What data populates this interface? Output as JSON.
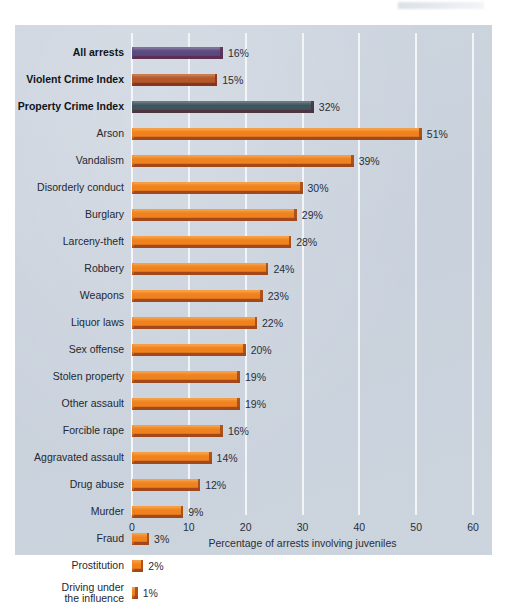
{
  "chart_data": {
    "type": "bar",
    "orientation": "horizontal",
    "title": "",
    "xlabel": "Percentage of arrests involving juveniles",
    "ylabel": "",
    "xlim": [
      0,
      60
    ],
    "xticks": [
      0,
      10,
      20,
      30,
      40,
      50,
      60
    ],
    "grid": true,
    "legend": false,
    "value_suffix": "%",
    "categories": [
      "All arrests",
      "Violent Crime Index",
      "Property Crime Index",
      "Arson",
      "Vandalism",
      "Disorderly conduct",
      "Burglary",
      "Larceny-theft",
      "Robbery",
      "Weapons",
      "Liquor laws",
      "Sex offense",
      "Stolen property",
      "Other assault",
      "Forcible rape",
      "Aggravated assault",
      "Drug abuse",
      "Murder",
      "Fraud",
      "Prostitution",
      "Driving under the influence"
    ],
    "values": [
      16,
      15,
      32,
      51,
      39,
      30,
      29,
      28,
      24,
      23,
      22,
      20,
      19,
      19,
      16,
      14,
      12,
      9,
      3,
      2,
      1
    ],
    "value_labels": [
      "16%",
      "15%",
      "32%",
      "51%",
      "39%",
      "30%",
      "29%",
      "28%",
      "24%",
      "23%",
      "22%",
      "20%",
      "19%",
      "19%",
      "16%",
      "14%",
      "12%",
      "9%",
      "3%",
      "2%",
      "1%"
    ],
    "bar_colors": [
      "#5b4a82",
      "#b4572a",
      "#3e5560",
      "#f0821e",
      "#f0821e",
      "#f0821e",
      "#f0821e",
      "#f0821e",
      "#f0821e",
      "#f0821e",
      "#f0821e",
      "#f0821e",
      "#f0821e",
      "#f0821e",
      "#f0821e",
      "#f0821e",
      "#f0821e",
      "#f0821e",
      "#f0821e",
      "#f0821e",
      "#f0821e"
    ],
    "emphasis": [
      true,
      true,
      true,
      false,
      false,
      false,
      false,
      false,
      false,
      false,
      false,
      false,
      false,
      false,
      false,
      false,
      false,
      false,
      false,
      false,
      false
    ],
    "label_lines": [
      [
        "All arrests"
      ],
      [
        "Violent Crime Index"
      ],
      [
        "Property Crime Index"
      ],
      [
        "Arson"
      ],
      [
        "Vandalism"
      ],
      [
        "Disorderly conduct"
      ],
      [
        "Burglary"
      ],
      [
        "Larceny-theft"
      ],
      [
        "Robbery"
      ],
      [
        "Weapons"
      ],
      [
        "Liquor laws"
      ],
      [
        "Sex offense"
      ],
      [
        "Stolen property"
      ],
      [
        "Other assault"
      ],
      [
        "Forcible rape"
      ],
      [
        "Aggravated assault"
      ],
      [
        "Drug abuse"
      ],
      [
        "Murder"
      ],
      [
        "Fraud"
      ],
      [
        "Prostitution"
      ],
      [
        "Driving under",
        "the influence"
      ]
    ]
  },
  "colors": {
    "panel_background": "#ccd4de",
    "gridline": "#f4f7fa",
    "text": "#2a2f38",
    "orange_bar": "#f0821e",
    "orange_bar_shadow": "#c0441a",
    "purple_bar": "#5b4a82",
    "sienna_bar": "#b4572a",
    "slate_bar": "#3e5560"
  }
}
